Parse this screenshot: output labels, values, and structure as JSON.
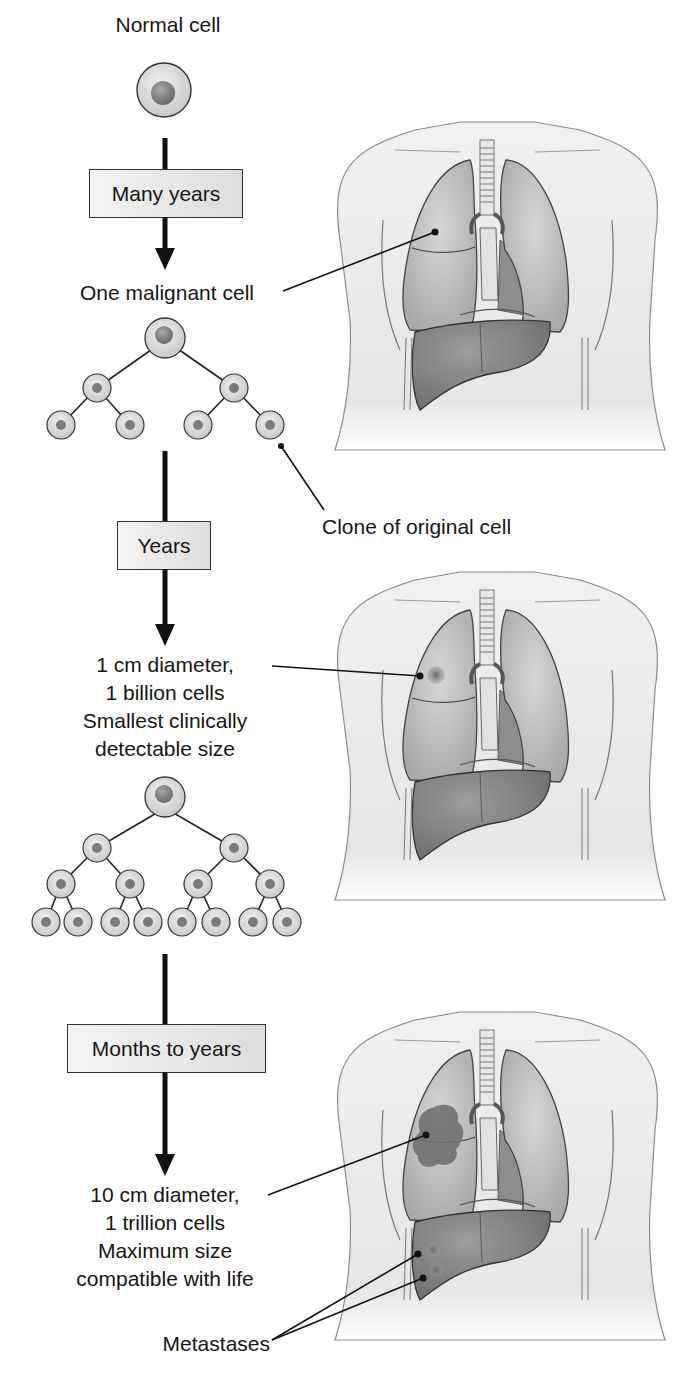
{
  "diagram": {
    "title_implied": "Tumor growth progression",
    "colors": {
      "arrow": "#111111",
      "cell_fill": "#d9d9d9",
      "cell_nucleus": "#7a7a7a",
      "lung": "#bdbdbd",
      "liver": "#8a8a8a",
      "tumor": "#6e6e6e",
      "body_outline": "#555555"
    },
    "stages": [
      {
        "top_label": "Normal cell"
      },
      {
        "interval": "Many years"
      },
      {
        "result_label": "One malignant cell"
      },
      {
        "interval": "Years"
      },
      {
        "result_lines": [
          "1 cm diameter,",
          "1 billion cells",
          "Smallest clinically",
          "detectable size"
        ]
      },
      {
        "interval": "Months to years"
      },
      {
        "result_lines": [
          "10 cm diameter,",
          "1 trillion cells",
          "Maximum size",
          "compatible with life"
        ]
      }
    ],
    "callouts": {
      "clone": "Clone of original cell",
      "metastases": "Metastases"
    },
    "labels": {
      "normal_cell": "Normal cell",
      "many_years": "Many years",
      "one_malignant": "One malignant cell",
      "years": "Years",
      "stage2_l1": "1 cm diameter,",
      "stage2_l2": "1 billion cells",
      "stage2_l3": "Smallest clinically",
      "stage2_l4": "detectable size",
      "months_to_years": "Months to years",
      "stage3_l1": "10 cm diameter,",
      "stage3_l2": "1 trillion cells",
      "stage3_l3": "Maximum size",
      "stage3_l4": "compatible with life"
    },
    "tree1": {
      "levels": [
        1,
        2,
        4
      ]
    },
    "tree2": {
      "levels": [
        1,
        2,
        4,
        8
      ]
    }
  }
}
